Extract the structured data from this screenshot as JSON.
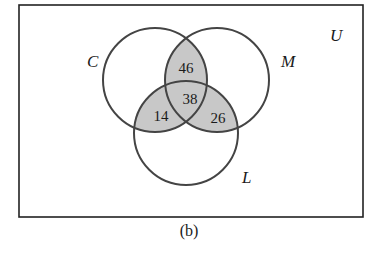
{
  "diagram": {
    "type": "venn",
    "universe_label": "U",
    "sets": [
      {
        "label": "C"
      },
      {
        "label": "M"
      },
      {
        "label": "L"
      }
    ],
    "regions": {
      "C_and_M_only": "46",
      "C_and_M_and_L": "38",
      "C_and_L_only": "14",
      "M_and_L_only": "26"
    },
    "shading_color": "#c8c8c8",
    "caption": "(b)"
  }
}
